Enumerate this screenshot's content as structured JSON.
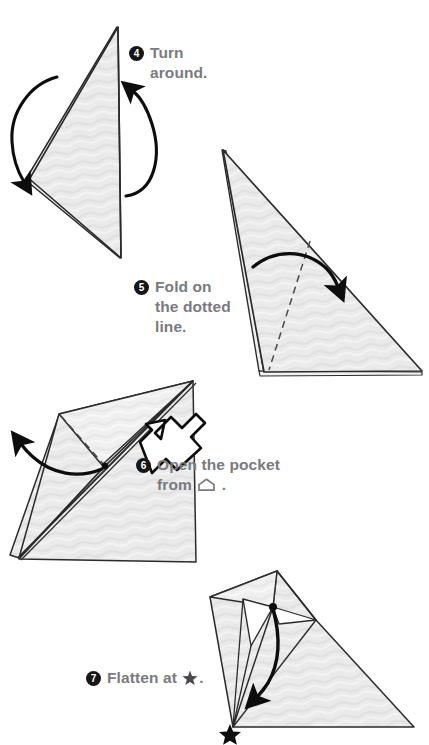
{
  "document": {
    "title": "Origami folding instructions, steps 4 through 7",
    "page_background": "#ffffff",
    "paper_fill": "#e9e9e9",
    "paper_fill_light": "#f2f2f2",
    "paper_outline": "#2b2b2b",
    "text_color": "#7a7a7f",
    "badge_color": "#16161a",
    "badge_text_color": "#ffffff"
  },
  "steps": [
    {
      "number": "4",
      "text": "Turn\naround.",
      "diagram_name": "diagram-step-4",
      "arrows": [
        "curved-arrow-left-down",
        "curved-arrow-right-up"
      ],
      "markings": []
    },
    {
      "number": "5",
      "text": "Fold on\nthe dotted\nline.",
      "diagram_name": "diagram-step-5",
      "arrows": [
        "curved-arrow-fold-right"
      ],
      "markings": [
        "dotted-fold-line"
      ]
    },
    {
      "number": "6",
      "text_before_symbol": "Open the pocket\nfrom ",
      "symbol": "pocket-house-symbol",
      "text_after_symbol": " .",
      "text": "Open the pocket from .",
      "diagram_name": "diagram-step-6",
      "arrows": [
        "curved-arrow-open-left",
        "hollow-pocket-arrow"
      ],
      "markings": [
        "dotted-fold-line",
        "pivot-dot"
      ]
    },
    {
      "number": "7",
      "text_before_symbol": "Flatten at ",
      "symbol": "star-symbol",
      "text_after_symbol": ".",
      "text": "Flatten at ★.",
      "diagram_name": "diagram-step-7",
      "arrows": [
        "curved-arrow-flatten-down"
      ],
      "markings": [
        "pivot-dot",
        "star-marker"
      ]
    }
  ]
}
